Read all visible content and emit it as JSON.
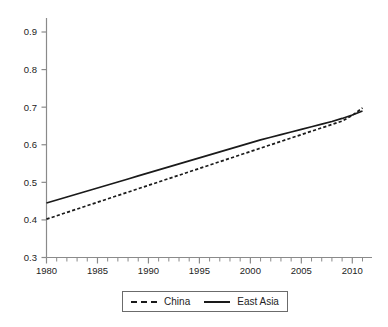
{
  "chart_data": {
    "type": "line",
    "title": "",
    "subtitle": "",
    "xlabel": "",
    "ylabel": "",
    "xlim": [
      1980,
      2011
    ],
    "ylim": [
      0.3,
      0.93
    ],
    "grid": false,
    "legend_position": "bottom",
    "x_major_ticks": [
      1980,
      1985,
      1990,
      1995,
      2000,
      2005,
      2010
    ],
    "x_tick_labels": [
      "1980",
      "1985",
      "1990",
      "1995",
      "2000",
      "2005",
      "2010"
    ],
    "x_minor_tick_interval": 1,
    "y_ticks": [
      0.3,
      0.4,
      0.5,
      0.6,
      0.7,
      0.8,
      0.9
    ],
    "y_tick_labels": [
      "0.3",
      "0.4",
      "0.5",
      "0.6",
      "0.7",
      "0.8",
      "0.9"
    ],
    "x": [
      1980,
      1981,
      1982,
      1983,
      1984,
      1985,
      1986,
      1987,
      1988,
      1989,
      1990,
      1991,
      1992,
      1993,
      1994,
      1995,
      1996,
      1997,
      1998,
      1999,
      2000,
      2001,
      2002,
      2003,
      2004,
      2005,
      2006,
      2007,
      2008,
      2009,
      2010,
      2011
    ],
    "series": [
      {
        "name": "China",
        "style": "dashed",
        "color": "#1a1a1a",
        "values": [
          0.402,
          0.411,
          0.42,
          0.429,
          0.438,
          0.447,
          0.456,
          0.465,
          0.474,
          0.483,
          0.492,
          0.501,
          0.51,
          0.519,
          0.528,
          0.537,
          0.546,
          0.555,
          0.564,
          0.573,
          0.582,
          0.591,
          0.6,
          0.609,
          0.618,
          0.627,
          0.636,
          0.645,
          0.654,
          0.663,
          0.678,
          0.698
        ]
      },
      {
        "name": "East Asia",
        "style": "solid",
        "color": "#1a1a1a",
        "values": [
          0.445,
          0.453,
          0.461,
          0.469,
          0.477,
          0.485,
          0.493,
          0.501,
          0.509,
          0.517,
          0.525,
          0.533,
          0.541,
          0.549,
          0.557,
          0.565,
          0.573,
          0.581,
          0.589,
          0.597,
          0.605,
          0.613,
          0.62,
          0.627,
          0.634,
          0.641,
          0.648,
          0.655,
          0.662,
          0.67,
          0.679,
          0.69
        ]
      }
    ]
  },
  "legend": {
    "items": [
      {
        "label": "China",
        "style": "dashed"
      },
      {
        "label": "East Asia",
        "style": "solid"
      }
    ]
  },
  "axes": {
    "y_labels": [
      "0.9",
      "0.8",
      "0.7",
      "0.6",
      "0.5",
      "0.4",
      "0.3"
    ],
    "x_labels": [
      "1980",
      "1985",
      "1990",
      "1995",
      "2000",
      "2005",
      "2010"
    ]
  }
}
